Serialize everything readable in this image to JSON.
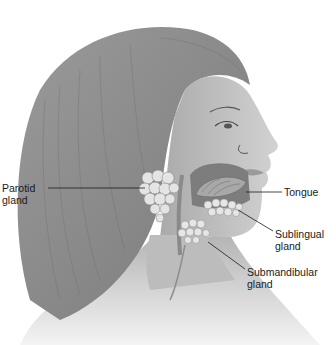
{
  "figure": {
    "labels": [
      {
        "id": "parotid",
        "line1": "Parotid",
        "line2": "gland"
      },
      {
        "id": "tongue",
        "line1": "Tongue",
        "line2": ""
      },
      {
        "id": "sublingual",
        "line1": "Sublingual",
        "line2": "gland"
      },
      {
        "id": "submandibular",
        "line1": "Submandibular",
        "line2": "gland"
      }
    ]
  },
  "colors": {
    "background": "#ffffff",
    "hair": "#8a8a8a",
    "skin": "#c4c4c4",
    "gland": "#e2e2e2",
    "leader_line": "#1a1a1a",
    "text": "#1a1a1a"
  }
}
